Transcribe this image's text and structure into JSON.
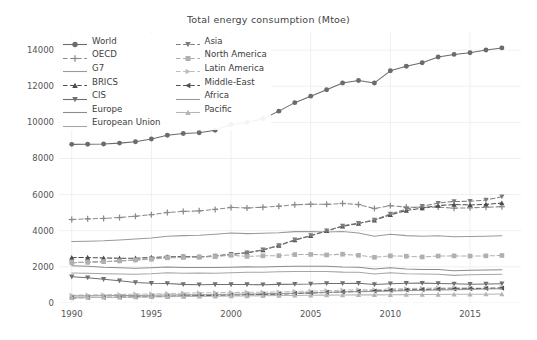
{
  "chart_data": {
    "type": "line",
    "title": "Total energy consumption (Mtoe)",
    "xlabel": "",
    "ylabel": "",
    "xlim": [
      1989.2,
      2018.2
    ],
    "ylim": [
      0,
      15000
    ],
    "yticks": [
      0,
      2000,
      4000,
      6000,
      8000,
      10000,
      12000,
      14000
    ],
    "xticks": [
      1990,
      1995,
      2000,
      2005,
      2010,
      2015
    ],
    "grid": true,
    "legend_position": "upper-left",
    "x": [
      1990,
      1991,
      1992,
      1993,
      1994,
      1995,
      1996,
      1997,
      1998,
      1999,
      2000,
      2001,
      2002,
      2003,
      2004,
      2005,
      2006,
      2007,
      2008,
      2009,
      2010,
      2011,
      2012,
      2013,
      2014,
      2015,
      2016,
      2017
    ],
    "series": [
      {
        "name": "World",
        "marker": "circle",
        "linestyle": "solid",
        "color": "#6b6b6b",
        "values": [
          8780,
          8790,
          8800,
          8850,
          8930,
          9080,
          9280,
          9380,
          9420,
          9560,
          9880,
          9990,
          10200,
          10620,
          11090,
          11450,
          11800,
          12180,
          12320,
          12180,
          12850,
          13100,
          13300,
          13620,
          13760,
          13850,
          14000,
          14120
        ]
      },
      {
        "name": "OECD",
        "marker": "plus",
        "linestyle": "dashed",
        "color": "#8a8a8a",
        "values": [
          4620,
          4660,
          4680,
          4730,
          4800,
          4890,
          5010,
          5070,
          5100,
          5180,
          5290,
          5260,
          5300,
          5360,
          5440,
          5470,
          5460,
          5510,
          5450,
          5230,
          5390,
          5310,
          5290,
          5310,
          5250,
          5270,
          5300,
          5330
        ]
      },
      {
        "name": "G7",
        "marker": "none",
        "linestyle": "solid",
        "color": "#9a9a9a",
        "values": [
          3400,
          3420,
          3440,
          3490,
          3540,
          3600,
          3690,
          3730,
          3750,
          3810,
          3880,
          3840,
          3860,
          3890,
          3950,
          3960,
          3930,
          3960,
          3880,
          3700,
          3810,
          3730,
          3700,
          3720,
          3670,
          3680,
          3700,
          3720
        ]
      },
      {
        "name": "BRICS",
        "marker": "triangle-up",
        "linestyle": "dashed",
        "color": "#4d4d4d",
        "values": [
          2510,
          2520,
          2490,
          2480,
          2480,
          2520,
          2560,
          2570,
          2560,
          2600,
          2690,
          2780,
          2930,
          3180,
          3480,
          3720,
          3990,
          4250,
          4400,
          4580,
          4880,
          5120,
          5250,
          5390,
          5450,
          5430,
          5460,
          5530
        ]
      },
      {
        "name": "CIS",
        "marker": "triangle-down",
        "linestyle": "solid",
        "color": "#707070",
        "values": [
          1450,
          1400,
          1310,
          1230,
          1130,
          1090,
          1080,
          1030,
          1010,
          1020,
          1020,
          1020,
          1010,
          1030,
          1040,
          1050,
          1080,
          1080,
          1090,
          1020,
          1070,
          1090,
          1100,
          1080,
          1060,
          1040,
          1050,
          1070
        ]
      },
      {
        "name": "Europe",
        "marker": "none",
        "linestyle": "solid",
        "color": "#8c8c8c",
        "values": [
          2060,
          2030,
          1980,
          1950,
          1920,
          1950,
          1990,
          1970,
          1970,
          1960,
          1980,
          2000,
          1990,
          2020,
          2030,
          2030,
          2030,
          1990,
          1980,
          1880,
          1950,
          1880,
          1860,
          1850,
          1790,
          1810,
          1830,
          1840
        ]
      },
      {
        "name": "European Union",
        "marker": "none",
        "linestyle": "solid",
        "color": "#a5a5a5",
        "values": [
          1660,
          1650,
          1620,
          1600,
          1590,
          1620,
          1670,
          1650,
          1660,
          1650,
          1670,
          1700,
          1700,
          1730,
          1740,
          1740,
          1740,
          1710,
          1700,
          1610,
          1680,
          1620,
          1600,
          1590,
          1530,
          1560,
          1580,
          1590
        ]
      },
      {
        "name": "Asia",
        "marker": "triangle-down",
        "linestyle": "dashed",
        "color": "#7d7d7d",
        "values": [
          2230,
          2270,
          2290,
          2330,
          2370,
          2450,
          2520,
          2560,
          2550,
          2610,
          2700,
          2790,
          2950,
          3190,
          3500,
          3740,
          4000,
          4270,
          4420,
          4600,
          4930,
          5200,
          5360,
          5530,
          5620,
          5630,
          5700,
          5880
        ]
      },
      {
        "name": "North America",
        "marker": "square",
        "linestyle": "dashed",
        "color": "#b0b0b0",
        "values": [
          2230,
          2250,
          2290,
          2330,
          2380,
          2420,
          2500,
          2520,
          2530,
          2570,
          2640,
          2580,
          2610,
          2620,
          2680,
          2690,
          2660,
          2700,
          2640,
          2530,
          2610,
          2590,
          2550,
          2600,
          2610,
          2600,
          2610,
          2630
        ]
      },
      {
        "name": "Latin America",
        "marker": "triangle-right",
        "linestyle": "dashed",
        "color": "#bdbdbd",
        "values": [
          430,
          440,
          455,
          470,
          490,
          500,
          525,
          545,
          560,
          570,
          585,
          590,
          595,
          610,
          640,
          660,
          680,
          710,
          735,
          730,
          775,
          795,
          815,
          830,
          840,
          835,
          830,
          840
        ]
      },
      {
        "name": "Middle-East",
        "marker": "triangle-left",
        "linestyle": "dashed",
        "color": "#4f4f4f",
        "values": [
          280,
          295,
          310,
          325,
          340,
          355,
          375,
          390,
          405,
          420,
          440,
          455,
          475,
          495,
          525,
          555,
          585,
          615,
          645,
          665,
          700,
          720,
          745,
          765,
          780,
          795,
          810,
          825
        ]
      },
      {
        "name": "Africa",
        "marker": "none",
        "linestyle": "solid",
        "color": "#999999",
        "values": [
          390,
          395,
          400,
          410,
          420,
          430,
          440,
          450,
          460,
          470,
          485,
          495,
          510,
          525,
          545,
          565,
          585,
          605,
          625,
          640,
          665,
          680,
          700,
          720,
          740,
          755,
          770,
          785
        ]
      },
      {
        "name": "Pacific",
        "marker": "triangle-up",
        "linestyle": "solid",
        "color": "#b5b5b5",
        "values": [
          290,
          300,
          310,
          320,
          330,
          340,
          350,
          360,
          365,
          375,
          385,
          390,
          400,
          410,
          420,
          430,
          435,
          445,
          450,
          450,
          460,
          465,
          470,
          475,
          480,
          485,
          490,
          495
        ]
      }
    ],
    "legend_columns": [
      [
        "World",
        "OECD",
        "G7",
        "BRICS",
        "CIS",
        "Europe",
        "European Union"
      ],
      [
        "Asia",
        "North America",
        "Latin America",
        "Middle-East",
        "Africa",
        "Pacific"
      ]
    ]
  }
}
